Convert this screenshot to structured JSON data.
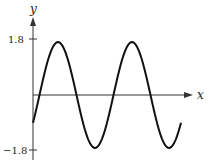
{
  "chart_data": {
    "type": "line",
    "title": "",
    "xlabel": "x",
    "ylabel": "y",
    "y_ticks": [
      {
        "value": 1.8,
        "label": "1.8"
      },
      {
        "value": -1.8,
        "label": "−1.8"
      }
    ],
    "x_ticks": [],
    "ylim": [
      -1.8,
      1.8
    ],
    "grid": false,
    "legend": null,
    "series": [
      {
        "name": "sinusoid",
        "description": "Sinusoidal curve spanning about two periods, starting below the x-axis and rising",
        "amplitude": 1.7,
        "periods_shown": 2,
        "points": [
          {
            "x": 0.0,
            "y": -0.87
          },
          {
            "x": 0.07,
            "y": 0.0
          },
          {
            "x": 0.34,
            "y": 1.7
          },
          {
            "x": 0.84,
            "y": -1.7
          },
          {
            "x": 1.34,
            "y": 1.7
          },
          {
            "x": 1.84,
            "y": -1.7
          },
          {
            "x": 2.0,
            "y": -0.87
          }
        ]
      }
    ],
    "colors": {
      "axis": "#333333",
      "curve": "#111111"
    }
  },
  "labels": {
    "x_axis": "x",
    "y_axis": "y",
    "y_top": "1.8",
    "y_bottom": "−1.8"
  }
}
